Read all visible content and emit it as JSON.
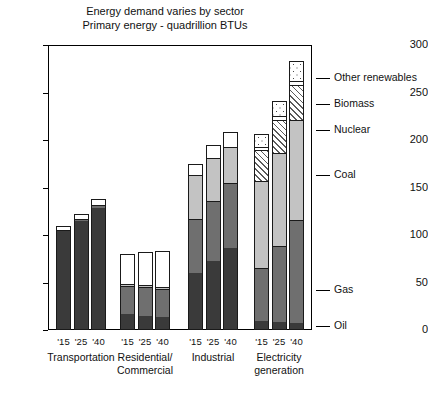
{
  "chart_data": {
    "type": "bar",
    "subtype": "stacked-grouped-column",
    "title": "Energy demand varies by sector",
    "subtitle": "Primary energy - quadrillion BTUs",
    "xlabel": "",
    "ylabel": "",
    "ylim": [
      0,
      300
    ],
    "yticks": [
      0,
      50,
      100,
      150,
      200,
      250,
      300
    ],
    "grid": false,
    "legend_position": "right",
    "groups": [
      "Transportation",
      "Residential/\nCommercial",
      "Industrial",
      "Electricity\ngeneration"
    ],
    "group_labels": [
      {
        "line1": "Transportation",
        "line2": ""
      },
      {
        "line1": "Residential/",
        "line2": "Commercial"
      },
      {
        "line1": "Industrial",
        "line2": ""
      },
      {
        "line1": "Electricity",
        "line2": "generation"
      }
    ],
    "categories": [
      "'15",
      "'25",
      "'40"
    ],
    "series": [
      {
        "name": "Oil",
        "key": "oil",
        "pattern": "solid-dark"
      },
      {
        "name": "Gas",
        "key": "gas",
        "pattern": "solid-mid-gray"
      },
      {
        "name": "Coal",
        "key": "coal",
        "pattern": "solid-light-gray"
      },
      {
        "name": "Nuclear",
        "key": "nuclear",
        "pattern": "diagonal-hatch"
      },
      {
        "name": "Biomass",
        "key": "biomass",
        "pattern": "white"
      },
      {
        "name": "Other renewables",
        "key": "renew",
        "pattern": "dotted"
      }
    ],
    "legend_entries": [
      "Other renewables",
      "Biomass",
      "Nuclear",
      "Coal",
      "Gas",
      "Oil"
    ],
    "bars": [
      {
        "group": "Transportation",
        "year": "'15",
        "total": 109,
        "segments": {
          "oil": 103,
          "gas": 1,
          "coal": 0,
          "nuclear": 0,
          "biomass": 5,
          "renew": 0
        }
      },
      {
        "group": "Transportation",
        "year": "'25",
        "total": 122,
        "segments": {
          "oil": 114,
          "gas": 2,
          "coal": 0,
          "nuclear": 0,
          "biomass": 6,
          "renew": 0
        }
      },
      {
        "group": "Transportation",
        "year": "'40",
        "total": 138,
        "segments": {
          "oil": 127,
          "gas": 4,
          "coal": 0,
          "nuclear": 0,
          "biomass": 7,
          "renew": 0
        }
      },
      {
        "group": "Residential/Commercial",
        "year": "'15",
        "total": 80,
        "segments": {
          "oil": 16,
          "gas": 29,
          "coal": 2,
          "nuclear": 0,
          "biomass": 33,
          "renew": 0
        }
      },
      {
        "group": "Residential/Commercial",
        "year": "'25",
        "total": 82,
        "segments": {
          "oil": 14,
          "gas": 30,
          "coal": 2,
          "nuclear": 0,
          "biomass": 36,
          "renew": 0
        }
      },
      {
        "group": "Residential/Commercial",
        "year": "'40",
        "total": 83,
        "segments": {
          "oil": 13,
          "gas": 29,
          "coal": 2,
          "nuclear": 0,
          "biomass": 39,
          "renew": 0
        }
      },
      {
        "group": "Industrial",
        "year": "'15",
        "total": 175,
        "segments": {
          "oil": 59,
          "gas": 57,
          "coal": 46,
          "nuclear": 0,
          "biomass": 13,
          "renew": 0
        }
      },
      {
        "group": "Industrial",
        "year": "'25",
        "total": 195,
        "segments": {
          "oil": 72,
          "gas": 63,
          "coal": 45,
          "nuclear": 0,
          "biomass": 15,
          "renew": 0
        }
      },
      {
        "group": "Industrial",
        "year": "'40",
        "total": 208,
        "segments": {
          "oil": 85,
          "gas": 69,
          "coal": 38,
          "nuclear": 0,
          "biomass": 16,
          "renew": 0
        }
      },
      {
        "group": "Electricity generation",
        "year": "'15",
        "total": 206,
        "segments": {
          "oil": 8,
          "gas": 56,
          "coal": 92,
          "nuclear": 32,
          "biomass": 4,
          "renew": 14
        }
      },
      {
        "group": "Electricity generation",
        "year": "'25",
        "total": 241,
        "segments": {
          "oil": 7,
          "gas": 80,
          "coal": 98,
          "nuclear": 35,
          "biomass": 4,
          "renew": 17
        }
      },
      {
        "group": "Electricity generation",
        "year": "'40",
        "total": 283,
        "segments": {
          "oil": 6,
          "gas": 109,
          "coal": 105,
          "nuclear": 37,
          "biomass": 4,
          "renew": 22
        }
      }
    ],
    "colors": {
      "oil": "#3a3a3a",
      "gas": "#6f6f6f",
      "coal": "#c3c3c3",
      "nuclear": "#ffffff",
      "biomass": "#ffffff",
      "renew": "#ffffff",
      "axis": "#000000",
      "text": "#111111",
      "background": "#ffffff"
    }
  }
}
